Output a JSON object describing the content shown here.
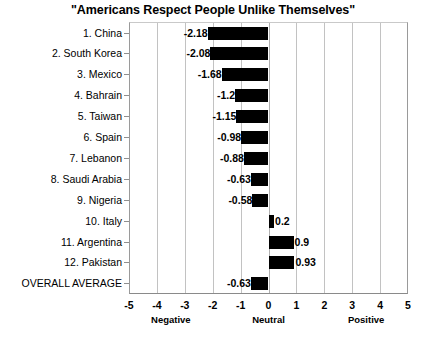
{
  "chart_data": {
    "type": "bar",
    "orientation": "horizontal",
    "title": "\"Americans Respect People Unlike Themselves\"",
    "xlabel": "",
    "ylabel": "",
    "xlim": [
      -5,
      5
    ],
    "grid": true,
    "legend": "none",
    "xticks": [
      "-5",
      "-4",
      "-3",
      "-2",
      "-1",
      "0",
      "1",
      "2",
      "3",
      "4",
      "5"
    ],
    "xtick_values": [
      -5,
      -4,
      -3,
      -2,
      -1,
      0,
      1,
      2,
      3,
      4,
      5
    ],
    "zone_labels": [
      {
        "text": "Negative",
        "at": -3.5
      },
      {
        "text": "Neutral",
        "at": 0
      },
      {
        "text": "Positive",
        "at": 3.5
      }
    ],
    "categories": [
      "1. China",
      "2. South Korea",
      "3. Mexico",
      "4. Bahrain",
      "5. Taiwan",
      "6. Spain",
      "7. Lebanon",
      "8. Saudi Arabia",
      "9. Nigeria",
      "10. Italy",
      "11. Argentina",
      "12. Pakistan",
      "OVERALL AVERAGE"
    ],
    "values": [
      -2.18,
      -2.08,
      -1.68,
      -1.2,
      -1.15,
      -0.98,
      -0.88,
      -0.63,
      -0.58,
      0.2,
      0.9,
      0.93,
      -0.63
    ],
    "value_labels": [
      "-2.18",
      "-2.08",
      "-1.68",
      "-1.2",
      "-1.15",
      "-0.98",
      "-0.88",
      "-0.63",
      "-0.58",
      "0.2",
      "0.9",
      "0.93",
      "-0.63"
    ],
    "bar_color": "#000000",
    "background_color": "#ffffff"
  }
}
